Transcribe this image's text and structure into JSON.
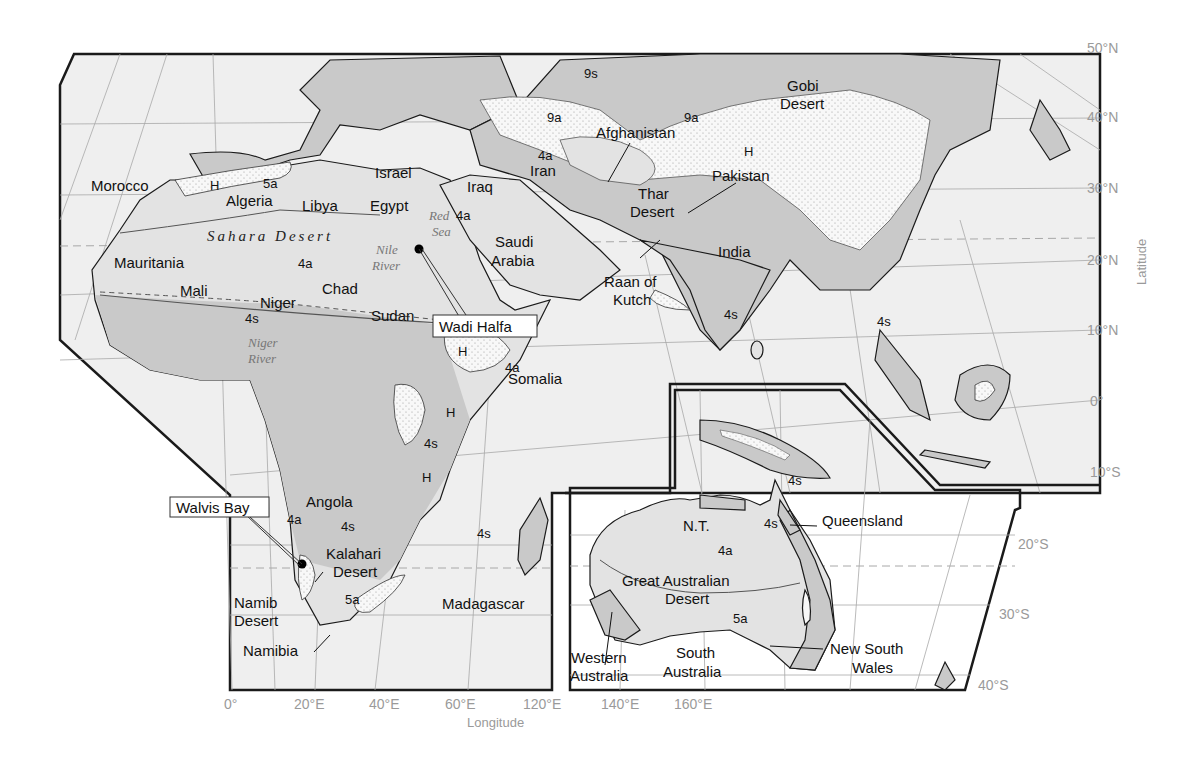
{
  "map": {
    "colors": {
      "ocean": "#efefef",
      "land_light": "#e4e4e4",
      "land_dark": "#c9c9c9",
      "stipple": "#f7f7f7",
      "border": "#1a1a1a",
      "grid": "#9a9a9a",
      "axis_text": "#9a9a9a"
    },
    "latitude_labels": [
      "50°N",
      "40°N",
      "30°N",
      "20°N",
      "10°N",
      "0°",
      "10°S",
      "20°S",
      "30°S",
      "40°S"
    ],
    "latitude_title": "Latitude",
    "longitude_labels": [
      "0°",
      "20°E",
      "40°E",
      "60°E",
      "120°E",
      "140°E",
      "160°E"
    ],
    "longitude_title": "Longitude",
    "places": {
      "morocco": "Morocco",
      "algeria": "Algeria",
      "libya": "Libya",
      "egypt": "Egypt",
      "israel": "Israel",
      "iraq": "Iraq",
      "iran": "Iran",
      "afghanistan": "Afghanistan",
      "pakistan": "Pakistan",
      "india": "India",
      "saudi_arabia_1": "Saudi",
      "saudi_arabia_2": "Arabia",
      "mauritania": "Mauritania",
      "mali": "Mali",
      "niger": "Niger",
      "chad": "Chad",
      "sudan": "Sudan",
      "somalia": "Somalia",
      "angola": "Angola",
      "namibia": "Namibia",
      "madagascar": "Madagascar",
      "queensland": "Queensland",
      "nt": "N.T.",
      "western_australia_1": "Western",
      "western_australia_2": "Australia",
      "south_australia_1": "South",
      "south_australia_2": "Australia",
      "nsw_1": "New South",
      "nsw_2": "Wales"
    },
    "deserts": {
      "sahara": "Sahara Desert",
      "gobi_1": "Gobi",
      "gobi_2": "Desert",
      "thar_1": "Thar",
      "thar_2": "Desert",
      "kalahari_1": "Kalahari",
      "kalahari_2": "Desert",
      "namib_1": "Namib",
      "namib_2": "Desert",
      "great_australian_1": "Great Australian",
      "great_australian_2": "Desert",
      "raan_1": "Raan of",
      "raan_2": "Kutch"
    },
    "water": {
      "red_sea_1": "Red",
      "red_sea_2": "Sea",
      "nile_1": "Nile",
      "nile_2": "River",
      "niger_river_1": "Niger",
      "niger_river_2": "River"
    },
    "callouts": {
      "wadi_halfa": "Wadi Halfa",
      "walvis_bay": "Walvis Bay"
    },
    "zone_codes": {
      "h": "H",
      "z5a": "5a",
      "z4a": "4a",
      "z4s": "4s",
      "z9a": "9a",
      "z9s": "9s"
    }
  }
}
